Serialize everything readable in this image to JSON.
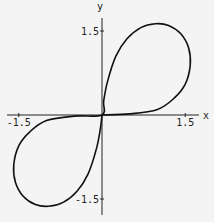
{
  "chart_data": {
    "type": "line",
    "title": "",
    "xlabel": "x",
    "ylabel": "y",
    "xlim": [
      -1.75,
      1.75
    ],
    "ylim": [
      -1.75,
      1.75
    ],
    "grid": false,
    "legend": null,
    "x_ticks": [
      {
        "value": -1.5,
        "label": "-1.5"
      },
      {
        "value": 1.5,
        "label": "1.5"
      }
    ],
    "y_ticks": [
      {
        "value": 1.5,
        "label": "1.5"
      },
      {
        "value": -1.5,
        "label": "-1.5"
      }
    ],
    "series": [
      {
        "name": "curve",
        "color": "#111111",
        "points": [
          [
            0,
            0
          ],
          [
            0.5,
            0.02
          ],
          [
            1.0,
            0.1
          ],
          [
            1.3,
            0.3
          ],
          [
            1.5,
            0.55
          ],
          [
            1.59,
            0.89
          ],
          [
            1.56,
            1.2
          ],
          [
            1.42,
            1.45
          ],
          [
            1.2,
            1.6
          ],
          [
            0.96,
            1.63
          ],
          [
            0.7,
            1.56
          ],
          [
            0.45,
            1.36
          ],
          [
            0.25,
            1.05
          ],
          [
            0.1,
            0.6
          ],
          [
            0.03,
            0.25
          ],
          [
            0,
            0
          ],
          [
            -0.5,
            -0.02
          ],
          [
            -1.0,
            -0.1
          ],
          [
            -1.3,
            -0.3
          ],
          [
            -1.5,
            -0.55
          ],
          [
            -1.59,
            -0.89
          ],
          [
            -1.56,
            -1.2
          ],
          [
            -1.42,
            -1.45
          ],
          [
            -1.2,
            -1.6
          ],
          [
            -0.96,
            -1.63
          ],
          [
            -0.7,
            -1.56
          ],
          [
            -0.45,
            -1.36
          ],
          [
            -0.25,
            -1.05
          ],
          [
            -0.1,
            -0.6
          ],
          [
            -0.03,
            -0.25
          ],
          [
            0,
            0
          ]
        ]
      }
    ]
  },
  "axes": {
    "x_label": "x",
    "y_label": "y"
  }
}
